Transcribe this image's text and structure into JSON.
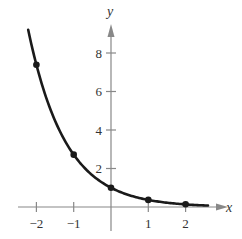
{
  "chart_data": {
    "type": "line",
    "title": "",
    "xlabel": "x",
    "ylabel": "y",
    "xlim": [
      -2.4,
      2.8
    ],
    "ylim": [
      -0.8,
      10.2
    ],
    "grid": false,
    "legend": null,
    "x_ticks": [
      -2,
      -1,
      1,
      2
    ],
    "x_tick_labels": [
      "−2",
      "−1",
      "1",
      "2"
    ],
    "y_ticks": [
      2,
      4,
      6,
      8
    ],
    "y_tick_labels": [
      "2",
      "4",
      "6",
      "8"
    ],
    "series": [
      {
        "name": "curve",
        "function": "e^(-x)",
        "color": "#1a1a1a",
        "x_range": [
          -2.22,
          2.6
        ],
        "points": [
          {
            "x": -2,
            "y": 7.39
          },
          {
            "x": -1,
            "y": 2.72
          },
          {
            "x": 0,
            "y": 1.0
          },
          {
            "x": 1,
            "y": 0.37
          },
          {
            "x": 2,
            "y": 0.14
          }
        ]
      }
    ],
    "axis_color": "#888888"
  }
}
